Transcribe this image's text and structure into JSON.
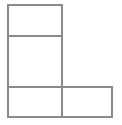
{
  "figure": {
    "background_color": "#ffffff",
    "line_color": "#8a8a8a",
    "fill_color": "#ffffff",
    "stroke_width": 2,
    "canvas": {
      "width": 122,
      "height": 125
    },
    "labels": [],
    "cells": [
      {
        "name": "top-left-rectangle",
        "x": 8,
        "y": 5,
        "width": 54,
        "height": 31
      },
      {
        "name": "middle-left-rectangle",
        "x": 8,
        "y": 36,
        "width": 54,
        "height": 51
      },
      {
        "name": "bottom-left-rectangle",
        "x": 8,
        "y": 87,
        "width": 54,
        "height": 30
      },
      {
        "name": "bottom-right-rectangle",
        "x": 62,
        "y": 87,
        "width": 50,
        "height": 30
      }
    ],
    "outline_path": "M 8 5 L 62 5 L 62 87 L 112 87 L 112 117 L 8 117 Z",
    "interior_lines": [
      {
        "name": "divider-top",
        "x1": 8,
        "y1": 36,
        "x2": 62,
        "y2": 36
      },
      {
        "name": "divider-bottom",
        "x1": 8,
        "y1": 87,
        "x2": 62,
        "y2": 87
      },
      {
        "name": "divider-vertical",
        "x1": 62,
        "y1": 87,
        "x2": 62,
        "y2": 117
      }
    ]
  }
}
